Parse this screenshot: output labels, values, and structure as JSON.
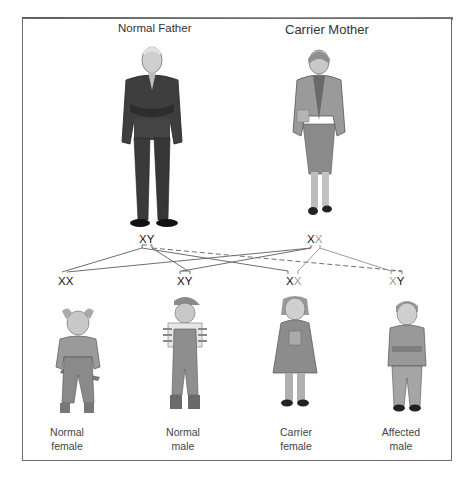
{
  "parents": {
    "father": {
      "label": "Normal Father",
      "genotype": {
        "first": "X",
        "second": "Y",
        "second_colored": false
      }
    },
    "mother": {
      "label": "Carrier Mother",
      "genotype": {
        "first": "X",
        "second": "X",
        "second_colored": true
      }
    }
  },
  "children": [
    {
      "label_line1": "Normal",
      "label_line2": "female",
      "genotype": {
        "first": "X",
        "second": "X",
        "first_colored": false,
        "second_colored": false
      }
    },
    {
      "label_line1": "Normal",
      "label_line2": "male",
      "genotype": {
        "first": "X",
        "second": "Y",
        "first_colored": false,
        "second_colored": false
      }
    },
    {
      "label_line1": "Carrier",
      "label_line2": "female",
      "genotype": {
        "first": "X",
        "second": "X",
        "first_colored": false,
        "second_colored": true
      }
    },
    {
      "label_line1": "Affected",
      "label_line2": "male",
      "genotype": {
        "first": "X",
        "second": "Y",
        "first_colored": true,
        "second_colored": false
      }
    }
  ],
  "colors": {
    "frame": "#6a6a6a",
    "inheritance_line": "#6e6e6e",
    "carrier_allele": "#9a9a9a",
    "text": "#222222"
  }
}
